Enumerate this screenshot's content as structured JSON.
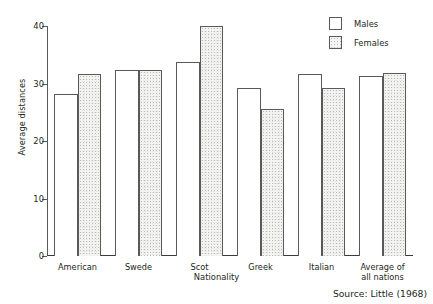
{
  "chart_data": {
    "type": "bar",
    "title": "",
    "subtitle": "",
    "xlabel": "Nationality",
    "ylabel": "Average distances",
    "categories": [
      "American",
      "Swede",
      "Scot",
      "Greek",
      "Italian",
      "Average of\nall nations"
    ],
    "series": [
      {
        "name": "Males",
        "values": [
          28.2,
          32.3,
          33.8,
          29.3,
          31.7,
          31.3
        ]
      },
      {
        "name": "Females",
        "values": [
          31.6,
          32.4,
          40.0,
          25.6,
          29.3,
          31.9
        ]
      }
    ],
    "ylim": [
      0,
      40
    ],
    "yticks": [
      0,
      10,
      20,
      30,
      40
    ],
    "ytick_labels": [
      "0",
      "10",
      "20",
      "30",
      "40"
    ],
    "grid": false,
    "legend_position": "top-right",
    "legend": [
      "Males",
      "Females"
    ],
    "annotations": [
      "Source: Little (1968)"
    ]
  },
  "axes": {
    "y_title": "Average distances",
    "x_title": "Nationality",
    "y_ticks": [
      {
        "label": "40",
        "value": 40
      },
      {
        "label": "30",
        "value": 30
      },
      {
        "label": "20",
        "value": 20
      },
      {
        "label": "10",
        "value": 10
      },
      {
        "label": "0",
        "value": 0
      }
    ]
  },
  "groups": [
    {
      "label": "American",
      "male": 28.2,
      "female": 31.6
    },
    {
      "label": "Swede",
      "male": 32.3,
      "female": 32.4
    },
    {
      "label": "Scot",
      "male": 33.8,
      "female": 40.0
    },
    {
      "label": "Greek",
      "male": 29.3,
      "female": 25.6
    },
    {
      "label": "Italian",
      "male": 31.7,
      "female": 29.3
    },
    {
      "label": "Average of\nall nations",
      "male": 31.3,
      "female": 31.9
    }
  ],
  "legend": {
    "items": [
      {
        "key": "male",
        "label": "Males"
      },
      {
        "key": "female",
        "label": "Females"
      }
    ]
  },
  "footer": {
    "source": "Source: Little (1968)"
  },
  "colors": {
    "ink": "#231f20",
    "axis": "#58595b",
    "male_fill": "#ffffff",
    "female_fill": "#f0f0ee"
  }
}
